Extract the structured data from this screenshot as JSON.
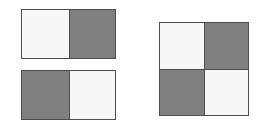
{
  "figure": {
    "title": "Checkerboard tiling comparison",
    "background_color": "#ffffff",
    "border_color": "#4d4d4d",
    "colors": {
      "light": "#f7f7f7",
      "dark": "#808080"
    }
  },
  "chart_data": {
    "type": "heatmap",
    "title": "Checkerboard tiling comparison",
    "xlabel": "",
    "ylabel": "",
    "grid": false,
    "legend": "none",
    "value_labels": {
      "0": "light",
      "1": "dark"
    },
    "panels": [
      {
        "id": "left-top",
        "label": "Two-cell horizontal pair (light, dark)",
        "rows": 1,
        "cols": 2,
        "values": [
          [
            0,
            1
          ]
        ],
        "cells": [
          "light",
          "dark"
        ]
      },
      {
        "id": "left-bottom",
        "label": "Two-cell horizontal pair (dark, light)",
        "rows": 1,
        "cols": 2,
        "values": [
          [
            1,
            0
          ]
        ],
        "cells": [
          "dark",
          "light"
        ]
      },
      {
        "id": "right",
        "label": "Four-cell checkerboard square",
        "rows": 2,
        "cols": 2,
        "values": [
          [
            0,
            1
          ],
          [
            1,
            0
          ]
        ],
        "cells": [
          "light",
          "dark",
          "dark",
          "light"
        ]
      }
    ]
  },
  "panels": {
    "left_top": {
      "name": "Two-cell horizontal pair",
      "cells": [
        {
          "name": "cell-light",
          "fill": "light"
        },
        {
          "name": "cell-dark",
          "fill": "dark"
        }
      ]
    },
    "left_bottom": {
      "name": "Two-cell horizontal pair inverted",
      "cells": [
        {
          "name": "cell-dark",
          "fill": "dark"
        },
        {
          "name": "cell-light",
          "fill": "light"
        }
      ]
    },
    "right": {
      "name": "Four-cell checkerboard square",
      "cells": [
        {
          "name": "cell-light",
          "fill": "light"
        },
        {
          "name": "cell-dark",
          "fill": "dark"
        },
        {
          "name": "cell-dark",
          "fill": "dark"
        },
        {
          "name": "cell-light",
          "fill": "light"
        }
      ]
    }
  }
}
